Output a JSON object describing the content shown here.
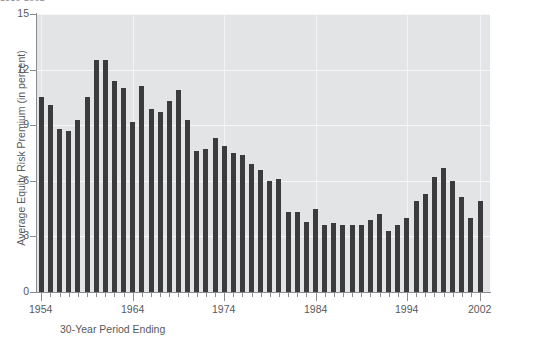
{
  "chart_data": {
    "type": "bar",
    "title": "1950-2002",
    "xlabel": "30-Year Period Ending",
    "ylabel": "Average Equity Risk Premium (in percent)",
    "ylim": [
      0,
      15
    ],
    "yticks": [
      0,
      3,
      6,
      9,
      12,
      15
    ],
    "ytick_labels": [
      "0",
      "3",
      "6",
      "9",
      "12",
      "15"
    ],
    "xlim": [
      1954,
      2002
    ],
    "xticks": [
      1954,
      1964,
      1974,
      1984,
      1994,
      2002
    ],
    "xtick_labels": [
      "1954",
      "1964",
      "1974",
      "1984",
      "1994",
      "2002"
    ],
    "grid": true,
    "legend": null,
    "bar_color": "#3b3b3d",
    "plot_background": "#e3e4e5",
    "gridline_color": "#f7f7f8",
    "axis_color": "#8a8c8e",
    "text_color": "#58595b",
    "categories": [
      "1954",
      "1955",
      "1956",
      "1957",
      "1958",
      "1959",
      "1960",
      "1961",
      "1962",
      "1963",
      "1964",
      "1965",
      "1966",
      "1967",
      "1968",
      "1969",
      "1970",
      "1971",
      "1972",
      "1973",
      "1974",
      "1975",
      "1976",
      "1977",
      "1978",
      "1979",
      "1980",
      "1981",
      "1982",
      "1983",
      "1984",
      "1985",
      "1986",
      "1987",
      "1988",
      "1989",
      "1990",
      "1991",
      "1992",
      "1993",
      "1994",
      "1995",
      "1996",
      "1997",
      "1998",
      "1999",
      "2000",
      "2001",
      "2002"
    ],
    "values": [
      10.5,
      10.1,
      8.8,
      8.7,
      9.3,
      10.5,
      12.5,
      12.5,
      11.4,
      11.0,
      9.2,
      11.1,
      9.9,
      9.7,
      10.3,
      10.9,
      9.3,
      7.6,
      7.7,
      8.3,
      7.9,
      7.5,
      7.4,
      6.9,
      6.6,
      6.0,
      6.1,
      4.3,
      4.3,
      3.8,
      4.5,
      3.6,
      3.7,
      3.6,
      3.6,
      3.6,
      3.9,
      4.2,
      3.3,
      3.6,
      4.0,
      4.9,
      5.3,
      6.2,
      6.7,
      6.0,
      5.1,
      4.0,
      4.9
    ]
  }
}
